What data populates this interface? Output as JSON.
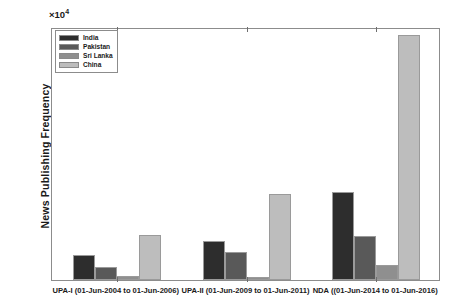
{
  "chart_data": {
    "type": "bar",
    "title": "",
    "subtitle": "",
    "xlabel": "",
    "ylabel": "News Publishing Frequency",
    "y_exponent_base": "×10",
    "y_exponent_power": "4",
    "y_exponent_label": "×10 4",
    "ylim": [
      0,
      40000
    ],
    "y_scale_factor": 10000,
    "ytick_labels": [
      "0",
      "0.5",
      "1",
      "1.5",
      "2",
      "2.5",
      "3",
      "3.5",
      "4"
    ],
    "ytick_values": [
      0,
      5000,
      10000,
      15000,
      20000,
      25000,
      30000,
      35000,
      40000
    ],
    "grid": false,
    "legend_position": "upper-left-inside",
    "categories": [
      "UPA-I (01-Jun-2004 to 01-Jun-2006)",
      "UPA-II (01-Jun-2009 to 01-Jun-2011)",
      "NDA ((01-Jun-2014 to 01-Jun-2016)"
    ],
    "series": [
      {
        "name": "India",
        "color": "#2d2d2d",
        "values": [
          3900,
          6200,
          13900
        ]
      },
      {
        "name": "Pakistan",
        "color": "#595959",
        "values": [
          2100,
          4500,
          7000
        ]
      },
      {
        "name": "Sri Lanka",
        "color": "#8f8f8f",
        "values": [
          600,
          500,
          2300
        ]
      },
      {
        "name": "China",
        "color": "#bdbdbd",
        "values": [
          7100,
          13600,
          38700
        ]
      }
    ]
  }
}
